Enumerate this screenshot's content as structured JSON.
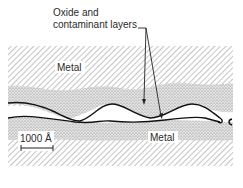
{
  "callout": {
    "line1": "Oxide and",
    "line2": "contaminant layers"
  },
  "regions": {
    "top_metal_label": "Metal",
    "bottom_metal_label": "Metal"
  },
  "scale_bar": {
    "label": "1000 Å"
  },
  "colors": {
    "hatch": "#7a7a7a",
    "stipple": "#b5b5b5",
    "line": "#111111",
    "background": "#ffffff"
  }
}
